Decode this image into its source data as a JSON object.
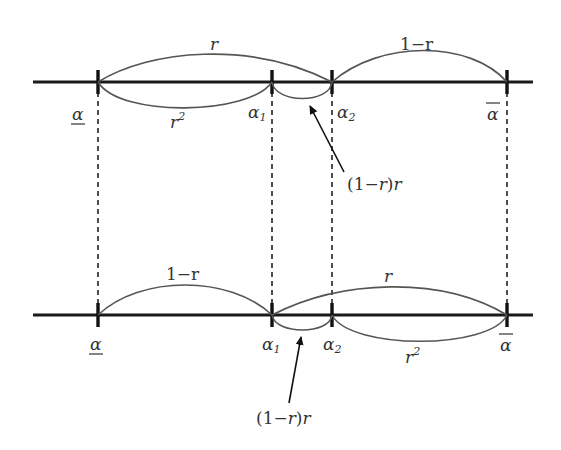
{
  "diagram": {
    "top_line": {
      "points": {
        "alpha_low": "α",
        "alpha_1": "α",
        "alpha_1_sub": "1",
        "alpha_2": "α",
        "alpha_2_sub": "2",
        "alpha_high": "α"
      },
      "arcs": {
        "upper_left": "r",
        "upper_right": "1−r",
        "lower_left": "r",
        "lower_left_sup": "2",
        "lower_small": ""
      },
      "annotation": {
        "open": "(1",
        "minus": "−",
        "r": "r",
        "close": ")",
        "r2": "r"
      }
    },
    "bottom_line": {
      "points": {
        "alpha_low": "α",
        "alpha_1": "α",
        "alpha_1_sub": "1",
        "alpha_2": "α",
        "alpha_2_sub": "2",
        "alpha_high": "α"
      },
      "arcs": {
        "upper_left": "1−r",
        "upper_right": "r",
        "lower_right": "r",
        "lower_right_sup": "2"
      },
      "annotation": {
        "open": "(1",
        "minus": "−",
        "r": "r",
        "close": ")",
        "r2": "r"
      }
    },
    "colors": {
      "axis": "#1a1a1a",
      "arc": "#555555",
      "text": "#333333"
    }
  }
}
